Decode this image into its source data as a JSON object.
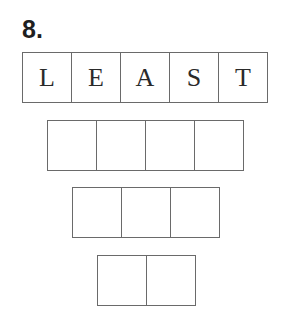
{
  "problem_number": "8.",
  "rows": [
    {
      "cells": [
        "L",
        "E",
        "A",
        "S",
        "T"
      ]
    },
    {
      "cells": [
        "",
        "",
        "",
        ""
      ]
    },
    {
      "cells": [
        "",
        "",
        ""
      ]
    },
    {
      "cells": [
        "",
        ""
      ]
    }
  ]
}
